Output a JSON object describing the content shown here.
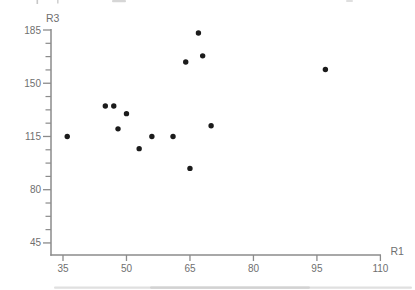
{
  "chart_data": {
    "type": "scatter",
    "title": "",
    "xlabel": "R1",
    "ylabel": "R3",
    "x_ticks": [
      35,
      50,
      65,
      80,
      95,
      110
    ],
    "y_ticks": [
      185,
      150,
      115,
      80,
      45
    ],
    "y_minor_ticks_per_interval": 3,
    "xlim": [
      32,
      111
    ],
    "ylim": [
      37,
      186
    ],
    "grid": false,
    "legend": false,
    "marker": "filled-circle",
    "points": [
      [
        36,
        115
      ],
      [
        45,
        135
      ],
      [
        47,
        135
      ],
      [
        48,
        120
      ],
      [
        50,
        130
      ],
      [
        53,
        107
      ],
      [
        56,
        115
      ],
      [
        61,
        115
      ],
      [
        64,
        164
      ],
      [
        65,
        94
      ],
      [
        67,
        183
      ],
      [
        68,
        168
      ],
      [
        70,
        122
      ],
      [
        97,
        159
      ]
    ]
  },
  "colors": {
    "background": "#ffffff",
    "axis": "#8b8b8b",
    "tick_label": "#6f6f6f",
    "point": "#1b1b1b",
    "scan_artifact": "#c2c2c2"
  }
}
